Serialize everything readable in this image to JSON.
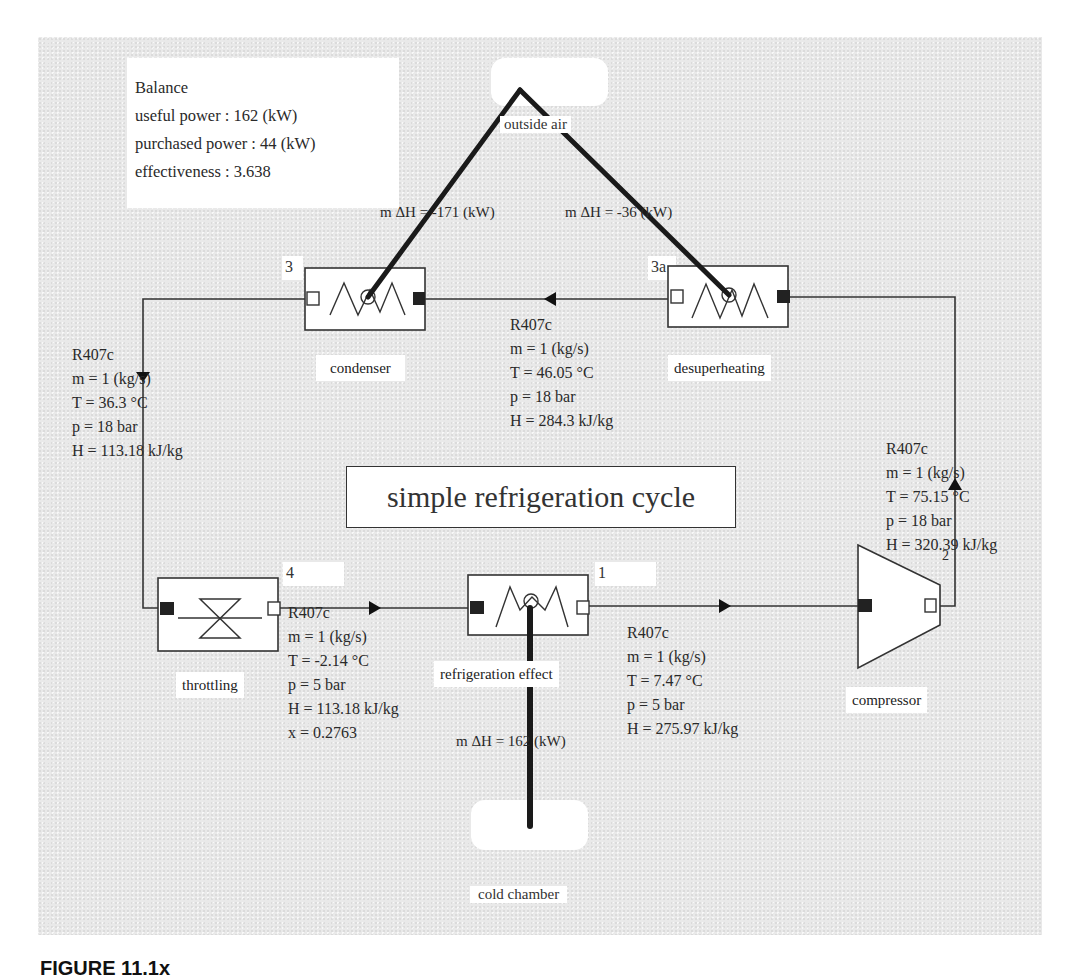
{
  "diagram": {
    "title": "simple refrigeration cycle",
    "colors": {
      "panel_bg": "#e9e9e9",
      "line": "#333333",
      "heat_line": "#222222",
      "box_bg": "#ffffff"
    },
    "balance": {
      "heading": "Balance",
      "useful_power": "useful power : 162 (kW)",
      "purchased_power": "purchased power : 44 (kW)",
      "effectiveness": "effectiveness : 3.638"
    },
    "sources": {
      "outside_air": {
        "label": "outside air"
      },
      "cold_chamber": {
        "label": "cold chamber"
      }
    },
    "heat_flows": {
      "condenser": "m ΔH = -171 (kW)",
      "desuperheating": "m ΔH = -36 (kW)",
      "refrigeration_effect": "m ΔH = 162 (kW)"
    },
    "components": [
      {
        "id": "condenser",
        "label": "condenser",
        "port_number": "3",
        "type": "heat-exchanger"
      },
      {
        "id": "desuperheating",
        "label": "desuperheating",
        "port_number": "3a",
        "type": "heat-exchanger"
      },
      {
        "id": "throttling",
        "label": "throttling",
        "port_number": "4",
        "type": "valve"
      },
      {
        "id": "refrigeration_effect",
        "label": "refrigeration effect",
        "port_number": "1",
        "type": "heat-exchanger"
      },
      {
        "id": "compressor",
        "label": "compressor",
        "port_number": "2",
        "type": "compressor"
      }
    ],
    "states": {
      "after_condenser": {
        "fluid": "R407c",
        "m": "m = 1 (kg/s)",
        "T": "T = 36.3 °C",
        "p": "p = 18 bar",
        "H": "H = 113.18 kJ/kg"
      },
      "after_desuperheating": {
        "fluid": "R407c",
        "m": "m = 1 (kg/s)",
        "T": "T = 46.05 °C",
        "p": "p = 18 bar",
        "H": "H = 284.3 kJ/kg"
      },
      "after_compressor": {
        "fluid": "R407c",
        "m": "m = 1 (kg/s)",
        "T": "T = 75.15 °C",
        "p": "p = 18 bar",
        "H": "H = 320.39 kJ/kg"
      },
      "after_throttling": {
        "fluid": "R407c",
        "m": "m = 1 (kg/s)",
        "T": "T = -2.14 °C",
        "p": "p = 5 bar",
        "H": "H = 113.18 kJ/kg",
        "x": "x = 0.2763"
      },
      "after_evaporator": {
        "fluid": "R407c",
        "m": "m = 1 (kg/s)",
        "T": "T = 7.47 °C",
        "p": "p = 5 bar",
        "H": "H = 275.97 kJ/kg"
      }
    }
  },
  "caption": "FIGURE 11.1x"
}
